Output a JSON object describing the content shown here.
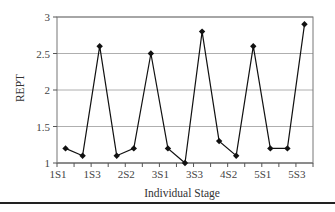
{
  "chart_data": {
    "type": "line",
    "title": "",
    "xlabel": "Individual Stage",
    "ylabel": "REPT",
    "categories": [
      "1S1",
      "1S2",
      "1S3",
      "2S1",
      "2S2",
      "2S3",
      "3S1",
      "3S2",
      "3S3",
      "4S1",
      "4S2",
      "4S3",
      "5S1",
      "5S2",
      "5S3"
    ],
    "x_tick_labels": [
      "1S1",
      "1S3",
      "2S2",
      "3S1",
      "3S3",
      "4S2",
      "5S1",
      "5S3"
    ],
    "series": [
      {
        "name": "REPT",
        "marker": "diamond",
        "color": "#111111",
        "values": [
          1.2,
          1.1,
          2.6,
          1.1,
          1.2,
          2.5,
          1.2,
          1.0,
          2.8,
          1.3,
          1.1,
          2.6,
          1.2,
          1.2,
          2.9
        ]
      }
    ],
    "ylim": [
      1,
      3
    ],
    "y_ticks": [
      1,
      1.5,
      2,
      2.5,
      3
    ],
    "y_tick_labels": [
      "1",
      "1.5",
      "2",
      "2.5",
      "3"
    ],
    "grid": true,
    "legend": "none"
  }
}
